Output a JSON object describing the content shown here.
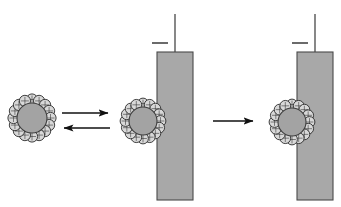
{
  "figure": {
    "background_color": "#ffffff",
    "width": 341,
    "height": 207
  },
  "colors": {
    "background": "#ffffff",
    "particle_core_fill": "#a3a3a3",
    "particle_core_stroke": "#3d3d3d",
    "corona_bead_fill": "#d8d8d8",
    "corona_bead_stroke": "#2b2b2b",
    "substrate_fill": "#a8a8a8",
    "substrate_stroke": "#4a4a4a",
    "arrow_color": "#111111",
    "tick_color": "#6b6b6b",
    "stem_color": "#555555"
  },
  "panels": [
    {
      "id": "panel-free-particle",
      "label": "Free coated particle in solution",
      "particle": {
        "id": "particle-free",
        "center_x": 32,
        "center_y": 118,
        "core_radius": 15,
        "corona_bead_count": 16,
        "corona_bead_radius": 5.6,
        "corona_ring_radius": 18.5,
        "state": "free"
      },
      "substrate": null
    },
    {
      "id": "panel-adsorbed-particle",
      "label": "Particle adsorbed at substrate surface",
      "particle": {
        "id": "particle-adsorbed",
        "center_x": 143,
        "center_y": 121,
        "core_radius": 14,
        "corona_bead_count": 16,
        "corona_bead_radius": 5.4,
        "corona_ring_radius": 17.5,
        "state": "contacting"
      },
      "substrate": {
        "id": "substrate-middle",
        "x": 157,
        "y": 52,
        "width": 36,
        "height": 148,
        "stem": {
          "x": 175,
          "y_top": 14,
          "y_bottom": 52
        },
        "tick": {
          "x1": 152,
          "x2": 168,
          "y": 43
        }
      }
    },
    {
      "id": "panel-embedded-particle",
      "label": "Particle spread and partly embedded at surface",
      "particle": {
        "id": "particle-embedded",
        "center_x": 292,
        "center_y": 122,
        "core_radius": 14,
        "corona_bead_count": 16,
        "corona_bead_radius": 5.4,
        "corona_ring_radius": 17.5,
        "state": "embedded"
      },
      "substrate": {
        "id": "substrate-right",
        "x": 297,
        "y": 52,
        "width": 36,
        "height": 148,
        "stem": {
          "x": 315,
          "y_top": 14,
          "y_bottom": 52
        },
        "tick": {
          "x1": 292,
          "x2": 308,
          "y": 43
        }
      }
    }
  ],
  "arrows": [
    {
      "id": "arrow-forward-adsorption",
      "direction": "right",
      "x1": 62,
      "x2": 110,
      "y": 113,
      "label": ""
    },
    {
      "id": "arrow-reverse-desorption",
      "direction": "left",
      "x1": 110,
      "x2": 62,
      "y": 128,
      "label": ""
    },
    {
      "id": "arrow-forward-embedding",
      "direction": "right",
      "x1": 213,
      "x2": 255,
      "y": 121,
      "label": ""
    }
  ],
  "accessibility": {
    "description": "Three-stage diagram. Left: a spherical particle with a grey core surrounded by a ring of sixteen small circular surfactant beads floats freely. A pair of horizontal arrows, the upper pointing right and the lower pointing left, indicates a reversible step to the middle stage where the same coated particle rests against the left face of a tall vertical grey rectangular substrate that has a thin vertical stem rising from its top and a short horizontal tick mark beside the stem. A single right-pointing arrow leads to the final stage where the coated particle is partly embedded into the left face of an identical substrate."
  }
}
